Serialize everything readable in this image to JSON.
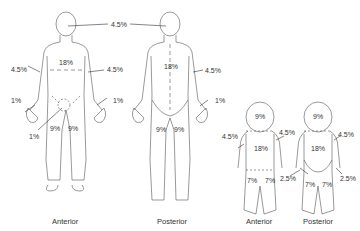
{
  "colors": {
    "line": "#444444",
    "text": "#333333",
    "background": "#ffffff"
  },
  "adult_anterior": {
    "caption": "Anterior",
    "labels": {
      "arm_left": "4.5%",
      "trunk": "18%",
      "arm_right": "4.5%",
      "hand_left": "1%",
      "hand_right": "1%",
      "genitals": "1%",
      "leg_left": "9%",
      "leg_right": "9%"
    }
  },
  "adult_posterior": {
    "caption": "Posterior",
    "labels": {
      "trunk": "18%",
      "arm_right": "4.5%",
      "hand_right": "1%",
      "leg_left": "9%",
      "leg_right": "9%"
    }
  },
  "head_shared": {
    "label": "4.5%"
  },
  "infant_anterior": {
    "caption": "Anterior",
    "labels": {
      "head": "9%",
      "arm_left": "4.5%",
      "arm_right": "4.5%",
      "trunk": "18%",
      "leg_left": "7%",
      "leg_right": "7%"
    }
  },
  "infant_posterior": {
    "caption": "Posterior",
    "labels": {
      "head": "9%",
      "arm_right": "4.5%",
      "trunk": "18%",
      "buttock_left": "2.5%",
      "buttock_right": "2.5%",
      "leg_left": "7%",
      "leg_right": "7%"
    }
  }
}
